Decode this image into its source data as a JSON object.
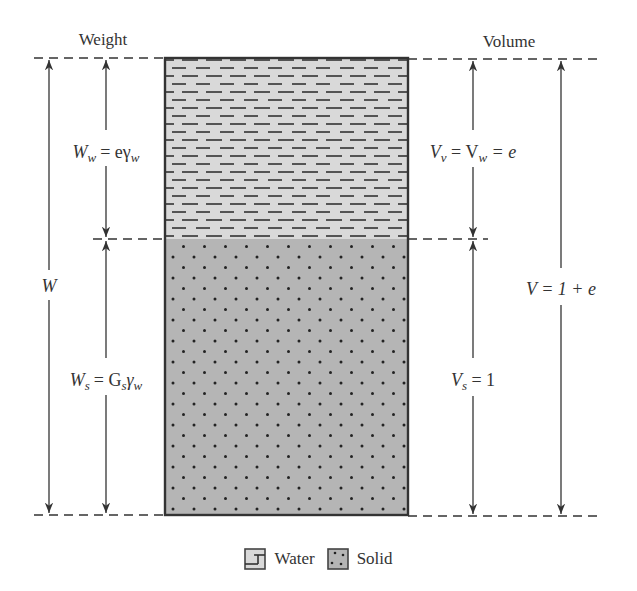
{
  "headers": {
    "weight": "Weight",
    "volume": "Volume"
  },
  "phases": {
    "water": {
      "name": "Water",
      "fill_color": "#d9d9d9",
      "weight_label": {
        "sym": "W",
        "sub": "w",
        "rhs": "= eγ",
        "rhs_sub": "w"
      },
      "volume_label": {
        "text1": "V",
        "sub1": "v",
        "mid": " = V",
        "sub2": "w",
        "end": " = e"
      }
    },
    "solid": {
      "name": "Solid",
      "fill_color": "#b5b5b5",
      "weight_label": {
        "sym": "W",
        "sub": "s",
        "rhs": "= G",
        "rhs_sub": "s",
        "rhs2": "γ",
        "rhs2_sub": "w"
      },
      "volume_label": {
        "text1": "V",
        "sub1": "s",
        "end": " = 1"
      }
    }
  },
  "totals": {
    "weight": "W",
    "volume": "V = 1 + e"
  },
  "legend": [
    {
      "label": "Water",
      "pattern": "dashes"
    },
    {
      "label": "Solid",
      "pattern": "dots"
    }
  ],
  "colors": {
    "line": "#333333",
    "water_fill": "#d9d9d9",
    "solid_fill": "#b5b5b5",
    "pattern_mark": "#222222"
  }
}
